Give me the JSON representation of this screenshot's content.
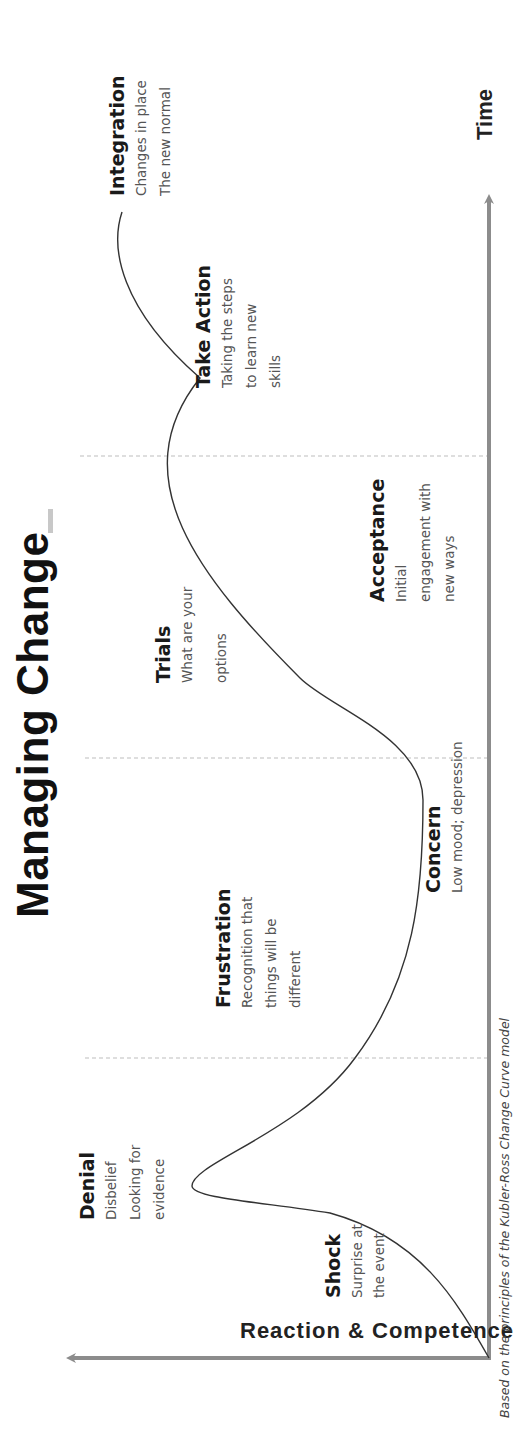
{
  "title": "Managing Change",
  "axes": {
    "x_label": "Time",
    "y_label": "Reaction & Competence"
  },
  "stages": [
    {
      "name": "Shock",
      "desc": [
        "Surprise at",
        "the event"
      ]
    },
    {
      "name": "Denial",
      "desc": [
        "Disbelief",
        "Looking for",
        "evidence"
      ]
    },
    {
      "name": "Frustration",
      "desc": [
        "Recognition that",
        "things will be",
        "different"
      ]
    },
    {
      "name": "Concern",
      "desc": [
        "Low mood; depression"
      ]
    },
    {
      "name": "Trials",
      "desc": [
        "What are your",
        "options"
      ]
    },
    {
      "name": "Acceptance",
      "desc": [
        "Initial",
        "engagement with",
        "new ways"
      ]
    },
    {
      "name": "Take Action",
      "desc": [
        "Taking the steps",
        "to learn new",
        "skills"
      ]
    },
    {
      "name": "Integration",
      "desc": [
        "Changes in place",
        "The new normal"
      ]
    }
  ],
  "footnote": "Based on the principles of the Kubler-Ross Change Curve model",
  "colors": {
    "axis": "#8c8c8c",
    "curve": "#333333",
    "divider": "#bdbdbd",
    "title": "#111111",
    "stage_name": "#1a1a1a",
    "stage_desc": "#555555"
  },
  "orientation": "rotated 90deg counter-clockwise (Time axis runs bottom-to-top)"
}
